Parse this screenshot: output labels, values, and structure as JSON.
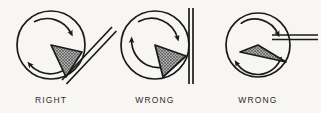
{
  "figure": {
    "background_color": "#f7f6f3",
    "ink_color": "#1a1a1a",
    "hatch_color": "#8c8c8c",
    "width": 321,
    "height": 113,
    "panels": [
      {
        "id": "panel-right",
        "caption": "RIGHT",
        "caption_x": 51,
        "caption_y": 103,
        "circle": {
          "cx": 51,
          "cy": 45,
          "r": 34
        },
        "rotation": "clockwise",
        "rotation_arc_radius": 27,
        "wedge": {
          "apex_x": 51,
          "apex_y": 45,
          "point1_x": 82,
          "point1_y": 52,
          "point2_x": 66,
          "point2_y": 77,
          "label": "cutting-wedge"
        },
        "tool": {
          "orientation": "diagonal",
          "x1": 62,
          "y1": 80,
          "x2": 112,
          "y2": 27,
          "label": "tool-edge-diagonal"
        }
      },
      {
        "id": "panel-wrong-vertical",
        "caption": "WRONG",
        "caption_x": 155,
        "caption_y": 103,
        "circle": {
          "cx": 155,
          "cy": 45,
          "r": 34
        },
        "rotation": "clockwise",
        "rotation_arc_radius": 27,
        "wedge": {
          "apex_x": 155,
          "apex_y": 45,
          "point1_x": 186,
          "point1_y": 56,
          "point2_x": 163,
          "point2_y": 77,
          "label": "cutting-wedge"
        },
        "tool": {
          "orientation": "vertical",
          "x1": 190,
          "y1": 8,
          "x2": 190,
          "y2": 84,
          "label": "tool-edge-vertical"
        }
      },
      {
        "id": "panel-wrong-horizontal",
        "caption": "WRONG",
        "caption_x": 258,
        "caption_y": 103,
        "circle": {
          "cx": 258,
          "cy": 45,
          "r": 32
        },
        "rotation": "clockwise",
        "rotation_arc_radius": 25,
        "wedge": {
          "apex_x": 258,
          "apex_y": 45,
          "point1_x": 286,
          "point1_y": 62,
          "point2_x": 240,
          "point2_y": 52,
          "label": "cutting-wedge"
        },
        "tool": {
          "orientation": "horizontal",
          "x1": 272,
          "y1": 37,
          "x2": 318,
          "y2": 37,
          "label": "tool-edge-horizontal"
        }
      }
    ]
  }
}
